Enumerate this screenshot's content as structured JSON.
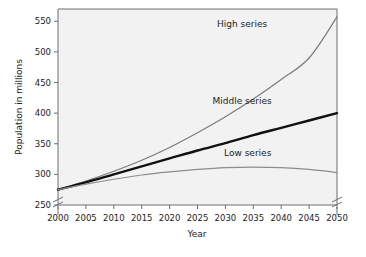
{
  "chart_data": {
    "type": "line",
    "title": "",
    "xlabel": "Year",
    "ylabel": "Population in millions",
    "xlim": [
      2000,
      2050
    ],
    "ylim": [
      250,
      570
    ],
    "grid": false,
    "legend_position": "inline-right",
    "axis_breaks": [
      "y-axis below 250",
      "right-axis below 250"
    ],
    "x": [
      2000,
      2005,
      2010,
      2015,
      2020,
      2025,
      2030,
      2035,
      2040,
      2045,
      2050
    ],
    "xticklabels": [
      "2000",
      "2005",
      "2010",
      "2015",
      "2020",
      "2025",
      "2030",
      "2035",
      "2040",
      "2045",
      "2050"
    ],
    "yticks": [
      250,
      300,
      350,
      400,
      450,
      500,
      550
    ],
    "yticklabels": [
      "250",
      "300",
      "350",
      "400",
      "450",
      "500",
      "550"
    ],
    "series": [
      {
        "name": "High series",
        "color": "#7b7b7b",
        "width": 1.2,
        "values": [
          275,
          289,
          305,
          323,
          344,
          368,
          394,
          423,
          455,
          490,
          557
        ]
      },
      {
        "name": "Middle series",
        "color": "#111111",
        "width": 2.4,
        "values": [
          275,
          287,
          300,
          313,
          326,
          339,
          351,
          364,
          376,
          388,
          400
        ]
      },
      {
        "name": "Low series",
        "color": "#8c8c8c",
        "width": 1.2,
        "values": [
          275,
          284,
          292,
          299,
          304,
          308,
          311,
          312,
          311,
          308,
          303
        ]
      }
    ],
    "annotations": [
      {
        "text": "High series",
        "x": 2033,
        "y": 540
      },
      {
        "text": "Middle series",
        "x": 2033,
        "y": 415
      },
      {
        "text": "Low series",
        "x": 2034,
        "y": 330
      }
    ]
  },
  "axis": {
    "x_title": "Year",
    "y_title": "Population in millions"
  },
  "style": {
    "plot_background": "#f2f2f2",
    "frame_color": "#6e6e6e",
    "text_color": "#1c1c1c",
    "page_background": "#ffffff"
  }
}
